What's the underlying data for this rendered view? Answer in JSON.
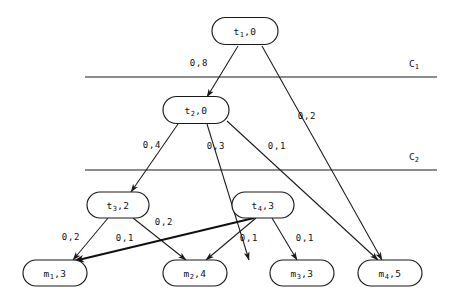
{
  "figure": {
    "title": "",
    "type": "directed-graph",
    "background_color": "#ffffff",
    "line_color": "#1a1a1a"
  },
  "nodes": [
    {
      "id": "t1",
      "label": "t",
      "sub": "1",
      "value": "0",
      "text": "t1,0",
      "x": 245,
      "y": 31,
      "w": 66,
      "h": 27
    },
    {
      "id": "t2",
      "label": "t",
      "sub": "2",
      "value": "0",
      "text": "t2,0",
      "x": 196,
      "y": 110,
      "w": 66,
      "h": 27
    },
    {
      "id": "t3",
      "label": "t",
      "sub": "3",
      "value": "2",
      "text": "t3,2",
      "x": 118,
      "y": 205,
      "w": 62,
      "h": 26
    },
    {
      "id": "t4",
      "label": "t",
      "sub": "4",
      "value": "3",
      "text": "t4,3",
      "x": 263,
      "y": 205,
      "w": 62,
      "h": 26
    },
    {
      "id": "m1",
      "label": "m",
      "sub": "1",
      "value": "3",
      "text": "m1,3",
      "x": 55,
      "y": 273,
      "w": 64,
      "h": 26
    },
    {
      "id": "m2",
      "label": "m",
      "sub": "2",
      "value": "4",
      "text": "m2,4",
      "x": 195,
      "y": 273,
      "w": 64,
      "h": 26
    },
    {
      "id": "m3",
      "label": "m",
      "sub": "3",
      "value": "3",
      "text": "m3,3",
      "x": 302,
      "y": 273,
      "w": 64,
      "h": 26
    },
    {
      "id": "m4",
      "label": "m",
      "sub": "4",
      "value": "5",
      "text": "m4,5",
      "x": 390,
      "y": 273,
      "w": 64,
      "h": 26
    }
  ],
  "edges": [
    {
      "id": "e-t1-t2",
      "from": "t1",
      "to": "t2",
      "label": "0,8",
      "label_x": 199,
      "label_y": 63,
      "x1": 238,
      "y1": 46,
      "x2": 207,
      "y2": 97,
      "thick": false
    },
    {
      "id": "e-t1-m4",
      "from": "t1",
      "to": "m4",
      "label": "0,2",
      "label_x": 307,
      "label_y": 116,
      "x1": 262,
      "y1": 46,
      "x2": 382,
      "y2": 260,
      "thick": false
    },
    {
      "id": "e-t2-t3",
      "from": "t2",
      "to": "t3",
      "label": "0,4",
      "label_x": 152,
      "label_y": 145,
      "x1": 178,
      "y1": 124,
      "x2": 131,
      "y2": 192,
      "thick": false
    },
    {
      "id": "e-t2-m2",
      "from": "t2",
      "to": "m2",
      "label": "0,3",
      "label_x": 216,
      "label_y": 146,
      "x1": 207,
      "y1": 124,
      "x2": 249,
      "y2": 260,
      "thick": false
    },
    {
      "id": "e-t2-m4",
      "from": "t2",
      "to": "m4",
      "label": "0,1",
      "label_x": 277,
      "label_y": 146,
      "x1": 227,
      "y1": 121,
      "x2": 378,
      "y2": 260,
      "thick": false
    },
    {
      "id": "e-t3-m1",
      "from": "t3",
      "to": "m1",
      "label": "0,2",
      "label_x": 71,
      "label_y": 237,
      "x1": 108,
      "y1": 218,
      "x2": 73,
      "y2": 260,
      "thick": false
    },
    {
      "id": "e-t3-m2",
      "from": "t3",
      "to": "m2",
      "label": "0,2",
      "label_x": 164,
      "label_y": 222,
      "x1": 133,
      "y1": 218,
      "x2": 186,
      "y2": 260,
      "thick": false
    },
    {
      "id": "e-t4-m1",
      "from": "t4",
      "to": "m1",
      "label": "0,1",
      "label_x": 125,
      "label_y": 238,
      "x1": 254,
      "y1": 218,
      "x2": 74,
      "y2": 261,
      "thick": true
    },
    {
      "id": "e-t4-m2",
      "from": "t4",
      "to": "m2",
      "label": "0,1",
      "label_x": 249,
      "label_y": 238,
      "x1": 256,
      "y1": 218,
      "x2": 206,
      "y2": 260,
      "thick": false
    },
    {
      "id": "e-t4-m3",
      "from": "t4",
      "to": "m3",
      "label": "0,1",
      "label_x": 305,
      "label_y": 238,
      "x1": 272,
      "y1": 218,
      "x2": 297,
      "y2": 260,
      "thick": false
    }
  ],
  "cuts": [
    {
      "id": "c1",
      "label": "C",
      "sub": "1",
      "text": "C1",
      "y": 77,
      "x1": 85,
      "x2": 437,
      "label_x": 409,
      "label_y": 64
    },
    {
      "id": "c2",
      "label": "C",
      "sub": "2",
      "text": "C2",
      "y": 170,
      "x1": 85,
      "x2": 437,
      "label_x": 409,
      "label_y": 157
    }
  ]
}
